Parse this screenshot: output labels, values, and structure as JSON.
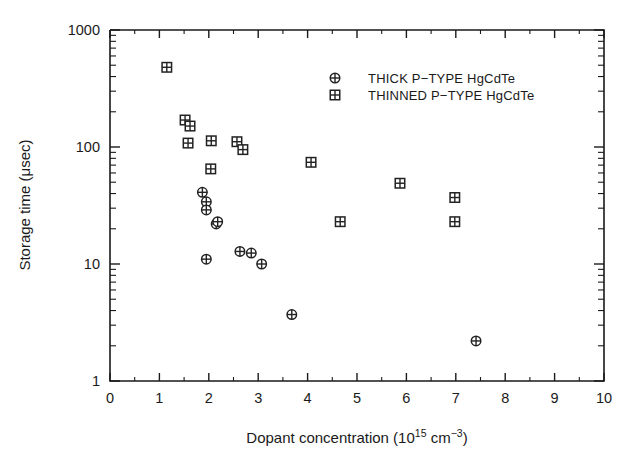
{
  "chart_data": {
    "type": "scatter",
    "title": "",
    "xlabel": "Dopant concentration (10^15 cm^-3)",
    "xlabel_parts": {
      "lead": "Dopant concentration (10",
      "exp1": "15",
      "mid": " cm",
      "exp2": "−3",
      "tail": ")"
    },
    "ylabel": "Storage time (μsec)",
    "xlim": [
      0,
      10
    ],
    "ylim": [
      1,
      1000
    ],
    "yscale": "log",
    "xscale": "linear",
    "grid": false,
    "xticks": [
      "0",
      "1",
      "2",
      "3",
      "4",
      "5",
      "6",
      "7",
      "8",
      "9",
      "10"
    ],
    "xtick_values": [
      0,
      1,
      2,
      3,
      4,
      5,
      6,
      7,
      8,
      9,
      10
    ],
    "yticks": [
      "1",
      "10",
      "100",
      "1000"
    ],
    "ytick_values": [
      1,
      10,
      100,
      1000
    ],
    "legend_position": "upper center",
    "series": [
      {
        "name": "THICK P−TYPE HgCdTe",
        "marker": "circle-cross",
        "points": [
          {
            "x": 1.87,
            "y": 41
          },
          {
            "x": 1.95,
            "y": 34
          },
          {
            "x": 1.95,
            "y": 29
          },
          {
            "x": 2.15,
            "y": 22
          },
          {
            "x": 2.18,
            "y": 23
          },
          {
            "x": 1.95,
            "y": 11
          },
          {
            "x": 2.63,
            "y": 12.8
          },
          {
            "x": 2.86,
            "y": 12.4
          },
          {
            "x": 3.07,
            "y": 10
          },
          {
            "x": 3.68,
            "y": 3.7
          },
          {
            "x": 7.41,
            "y": 2.2
          }
        ]
      },
      {
        "name": "THINNED P−TYPE HgCdTe",
        "marker": "square-cross",
        "points": [
          {
            "x": 1.15,
            "y": 480
          },
          {
            "x": 1.52,
            "y": 170
          },
          {
            "x": 1.62,
            "y": 151
          },
          {
            "x": 1.58,
            "y": 108
          },
          {
            "x": 2.05,
            "y": 113
          },
          {
            "x": 2.57,
            "y": 111
          },
          {
            "x": 2.69,
            "y": 95
          },
          {
            "x": 2.04,
            "y": 65
          },
          {
            "x": 4.07,
            "y": 74
          },
          {
            "x": 4.66,
            "y": 23
          },
          {
            "x": 5.87,
            "y": 49
          },
          {
            "x": 6.98,
            "y": 37
          },
          {
            "x": 6.98,
            "y": 23
          }
        ]
      }
    ]
  },
  "legend": {
    "entries": [
      {
        "marker": "circle-cross",
        "label": "THICK P−TYPE HgCdTe"
      },
      {
        "marker": "square-cross",
        "label": "THINNED P−TYPE HgCdTe"
      }
    ]
  },
  "colors": {
    "foreground": "#1a1a1a",
    "marker": "#222222",
    "background": "#ffffff"
  }
}
